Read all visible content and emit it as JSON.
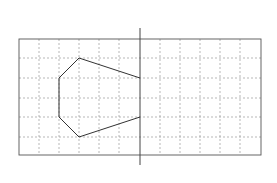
{
  "diagram": {
    "axis_labels": {
      "top": "ㄱ",
      "bottom": "ㄴ"
    },
    "vertices": [
      {
        "label": "ㄹ",
        "x": 79,
        "y": 58,
        "lx": 72,
        "ly": 55
      },
      {
        "label": "ㄷ",
        "x": 140,
        "y": 78,
        "lx": 131,
        "ly": 88
      },
      {
        "label": "ㅇ",
        "x": 140,
        "y": 117,
        "lx": 131,
        "ly": 129
      },
      {
        "label": "ㅅ",
        "x": 79,
        "y": 137,
        "lx": 75,
        "ly": 148
      },
      {
        "label": "ㅂ",
        "x": 59,
        "y": 117,
        "lx": 47,
        "ly": 120
      },
      {
        "label": "ㅁ",
        "x": 59,
        "y": 78,
        "lx": 47,
        "ly": 82
      }
    ],
    "numbered_points": [
      [
        "①",
        "②",
        "③",
        "④",
        "⑤"
      ],
      [
        "⑥",
        "⑦",
        "⑧",
        "⑨",
        "⑩"
      ],
      [
        "⑪",
        "⑫",
        "⑬",
        "⑭",
        "⑮"
      ],
      [
        "⑯",
        "⑰",
        "⑱",
        "⑲",
        "⑳"
      ],
      [
        "㉑",
        "㉒",
        "㉓",
        "㉔",
        "㉕"
      ]
    ]
  }
}
